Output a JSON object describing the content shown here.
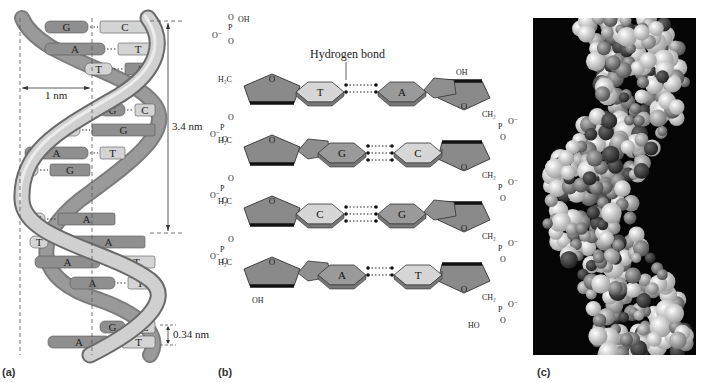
{
  "figure": {
    "panels": [
      {
        "id": "a",
        "label": "(a)",
        "type": "double-helix-ribbon-diagram",
        "measurements": {
          "width": "1 nm",
          "pitch": "3.4 nm",
          "rise": "0.34 nm"
        },
        "base_pairs": [
          {
            "left": "G",
            "right": "C"
          },
          {
            "left": "A",
            "right": "T"
          },
          {
            "left": "T",
            "right": "A"
          },
          {
            "left": "G",
            "right": "C"
          },
          {
            "left": "C",
            "right": "G"
          },
          {
            "left": "A",
            "right": "T"
          },
          {
            "left": "C",
            "right": "G"
          },
          {
            "left": "T",
            "right": "A"
          },
          {
            "left": "T",
            "right": "A"
          },
          {
            "left": "A",
            "right": "T"
          },
          {
            "left": "A",
            "right": "T"
          },
          {
            "left": "G",
            "right": "C"
          },
          {
            "left": "A",
            "right": "T"
          }
        ],
        "colors": {
          "ribbon": "#c8c8c8",
          "ribbon_edge": "#6a6a6a",
          "purine": "#8f8f8f",
          "pyrimidine": "#d4d4d4"
        }
      },
      {
        "id": "b",
        "label": "(b)",
        "type": "chemical-structure-diagram",
        "callout": "Hydrogen bond",
        "base_pairs": [
          {
            "left": "T",
            "right": "A"
          },
          {
            "left": "G",
            "right": "C"
          },
          {
            "left": "C",
            "right": "G"
          },
          {
            "left": "A",
            "right": "T"
          }
        ],
        "left_backbone": {
          "top_group": [
            "O",
            "P",
            "OH",
            "O⁻",
            "O"
          ],
          "sugar_label": "H₂C",
          "ring_oxygen": "O",
          "bottom_terminal": "OH"
        },
        "right_backbone": {
          "top_terminal": "OH",
          "sugar_label": "CH₂",
          "ring_oxygen": "O",
          "bottom_group": [
            "HO",
            "P",
            "O⁻",
            "O"
          ]
        },
        "phosphate_labels": {
          "p": "P",
          "o": "O",
          "o_minus": "O⁻",
          "oh": "OH",
          "ho": "HO"
        }
      },
      {
        "id": "c",
        "label": "(c)",
        "type": "space-filling-molecular-model-photo",
        "background": "#050505"
      }
    ]
  }
}
